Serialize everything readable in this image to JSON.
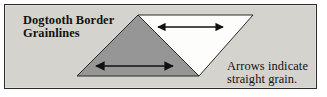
{
  "figure": {
    "name": "dogtooth-border-grainlines-diagram",
    "background_color": "#d5d3ce",
    "border_color": "#2b2b2b",
    "width": 327,
    "height": 97
  },
  "labels": {
    "dogtooth": "Dogtooth Border\nGrainlines",
    "arrows": "Arrows indicate\nstraight grain."
  },
  "shapes": {
    "gray_triangle": {
      "name": "upward-triangle",
      "fill": "#969696",
      "stroke": "#2b2b2b",
      "orientation": "point-up",
      "points": "137,14 198,75 76,75"
    },
    "white_triangle": {
      "name": "downward-triangle",
      "fill": "#fdfdfb",
      "stroke": "#2b2b2b",
      "orientation": "point-down",
      "points": "137,14 252,14 198,75"
    }
  },
  "arrows": {
    "color": "#111111",
    "lower": {
      "name": "lower-grainline-arrow",
      "x1": 95,
      "x2": 172,
      "y": 65,
      "double_headed": true
    },
    "upper": {
      "name": "upper-grainline-arrow",
      "x1": 157,
      "x2": 222,
      "y": 26,
      "double_headed": true
    }
  }
}
